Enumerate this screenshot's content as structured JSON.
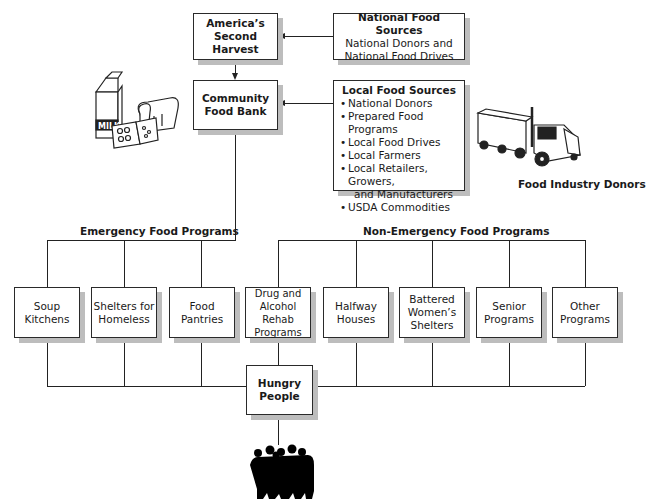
{
  "top": {
    "america_second_harvest": {
      "line1": "America’s",
      "line2": "Second Harvest"
    },
    "national_sources": {
      "title": "National Food Sources",
      "line1": "National Donors and",
      "line2": "National Food Drives"
    },
    "community_food_bank": {
      "line1": "Community",
      "line2": "Food Bank"
    },
    "local_sources": {
      "title": "Local Food Sources",
      "items": [
        "National Donors",
        "Prepared Food Programs",
        "Local Food Drives",
        "Local Farmers",
        "Local Retailers, Growers,",
        "USDA Commodities"
      ],
      "item5_cont": "and Manufacturers"
    }
  },
  "illustrations": {
    "groceries": {
      "milk_label": "MILK"
    },
    "truck_caption": "Food Industry Donors"
  },
  "groups": {
    "emergency": "Emergency Food Programs",
    "non_emergency": "Non-Emergency Food Programs"
  },
  "programs": [
    {
      "l1": "Soup",
      "l2": "Kitchens",
      "l3": ""
    },
    {
      "l1": "Shelters for",
      "l2": "Homeless",
      "l3": ""
    },
    {
      "l1": "Food",
      "l2": "Pantries",
      "l3": ""
    },
    {
      "l1": "Drug and",
      "l2": "Alcohol Rehab",
      "l3": "Programs"
    },
    {
      "l1": "Halfway",
      "l2": "Houses",
      "l3": ""
    },
    {
      "l1": "Battered",
      "l2": "Women’s",
      "l3": "Shelters"
    },
    {
      "l1": "Senior",
      "l2": "Programs",
      "l3": ""
    },
    {
      "l1": "Other",
      "l2": "Programs",
      "l3": ""
    }
  ],
  "bottom": {
    "hungry_people": {
      "line1": "Hungry",
      "line2": "People"
    }
  },
  "colors": {
    "line": "#222222",
    "shadow": "#bdbdbd",
    "box_fill": "#ffffff"
  }
}
